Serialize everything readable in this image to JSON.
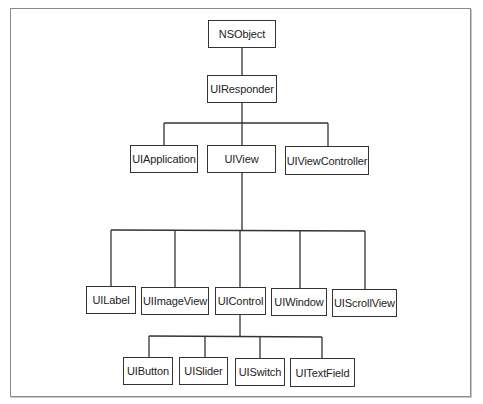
{
  "diagram": {
    "type": "class-hierarchy",
    "nodes": {
      "nsobject": "NSObject",
      "uiresponder": "UIResponder",
      "uiapplication": "UIApplication",
      "uiview": "UIView",
      "uiviewcontroller": "UIViewController",
      "uilabel": "UILabel",
      "uiimageview": "UIImageView",
      "uicontrol": "UIControl",
      "uiwindow": "UIWindow",
      "uiscrollview": "UIScrollView",
      "uibutton": "UIButton",
      "uislider": "UISlider",
      "uiswitch": "UISwitch",
      "uitextfield": "UITextField"
    },
    "edges": [
      [
        "NSObject",
        "UIResponder"
      ],
      [
        "UIResponder",
        "UIApplication"
      ],
      [
        "UIResponder",
        "UIView"
      ],
      [
        "UIResponder",
        "UIViewController"
      ],
      [
        "UIView",
        "UILabel"
      ],
      [
        "UIView",
        "UIImageView"
      ],
      [
        "UIView",
        "UIControl"
      ],
      [
        "UIView",
        "UIWindow"
      ],
      [
        "UIView",
        "UIScrollView"
      ],
      [
        "UIControl",
        "UIButton"
      ],
      [
        "UIControl",
        "UISlider"
      ],
      [
        "UIControl",
        "UISwitch"
      ],
      [
        "UIControl",
        "UITextField"
      ]
    ]
  }
}
